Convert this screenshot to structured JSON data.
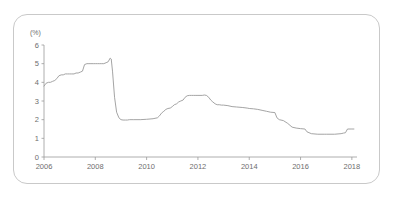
{
  "figure": {
    "background_color": "#ffffff",
    "border_color": "#c9c9c9",
    "axis_color": "#9a9a9a",
    "line_color": "#9a9a9a",
    "text_color": "#6e6e6e"
  },
  "chart_data": {
    "type": "line",
    "title": "",
    "subtitle": "",
    "xlabel": "",
    "ylabel": "",
    "unit_label": "(%)",
    "grid": false,
    "legend": null,
    "xlim": [
      2006.0,
      2018.2
    ],
    "ylim": [
      0,
      6
    ],
    "yticks": [
      0,
      1,
      2,
      3,
      4,
      5,
      6
    ],
    "ytick_labels": [
      "0",
      "1",
      "2",
      "3",
      "4",
      "5",
      "6"
    ],
    "xticks": [
      2006,
      2008,
      2010,
      2012,
      2014,
      2016,
      2018
    ],
    "xtick_labels": [
      "2006",
      "2008",
      "2010",
      "2012",
      "2014",
      "2016",
      "2018"
    ],
    "series": [
      {
        "name": "rate",
        "x": [
          2006.0,
          2006.08,
          2006.17,
          2006.25,
          2006.33,
          2006.42,
          2006.5,
          2006.58,
          2006.67,
          2006.75,
          2006.83,
          2006.92,
          2007.0,
          2007.08,
          2007.17,
          2007.25,
          2007.33,
          2007.42,
          2007.5,
          2007.58,
          2007.67,
          2007.75,
          2007.83,
          2007.92,
          2008.0,
          2008.08,
          2008.17,
          2008.25,
          2008.33,
          2008.42,
          2008.5,
          2008.58,
          2008.62,
          2008.67,
          2008.75,
          2008.83,
          2008.92,
          2009.0,
          2009.08,
          2009.17,
          2009.25,
          2009.33,
          2009.5,
          2009.75,
          2010.0,
          2010.25,
          2010.42,
          2010.5,
          2010.58,
          2010.67,
          2010.75,
          2010.83,
          2010.92,
          2011.0,
          2011.08,
          2011.17,
          2011.25,
          2011.33,
          2011.42,
          2011.5,
          2011.58,
          2011.67,
          2011.75,
          2011.83,
          2011.92,
          2012.0,
          2012.08,
          2012.17,
          2012.25,
          2012.33,
          2012.42,
          2012.5,
          2012.58,
          2012.67,
          2012.75,
          2012.83,
          2012.92,
          2013.0,
          2013.17,
          2013.33,
          2013.5,
          2013.75,
          2013.92,
          2014.0,
          2014.17,
          2014.33,
          2014.5,
          2014.67,
          2014.83,
          2015.0,
          2015.08,
          2015.17,
          2015.33,
          2015.5,
          2015.67,
          2015.83,
          2016.0,
          2016.17,
          2016.25,
          2016.42,
          2016.67,
          2016.92,
          2017.0,
          2017.33,
          2017.58,
          2017.67,
          2017.75,
          2017.83,
          2018.0,
          2018.08
        ],
        "y": [
          3.8,
          3.95,
          4.0,
          4.0,
          4.05,
          4.1,
          4.2,
          4.35,
          4.4,
          4.4,
          4.45,
          4.45,
          4.45,
          4.45,
          4.45,
          4.5,
          4.5,
          4.55,
          4.6,
          4.95,
          5.0,
          5.0,
          5.0,
          5.0,
          5.0,
          5.0,
          5.0,
          5.0,
          5.0,
          5.05,
          5.1,
          5.3,
          5.25,
          4.6,
          3.2,
          2.4,
          2.1,
          2.0,
          1.98,
          1.98,
          1.98,
          2.0,
          2.0,
          2.0,
          2.02,
          2.05,
          2.1,
          2.2,
          2.35,
          2.45,
          2.55,
          2.6,
          2.62,
          2.7,
          2.8,
          2.85,
          2.95,
          3.0,
          3.05,
          3.2,
          3.28,
          3.3,
          3.3,
          3.3,
          3.3,
          3.3,
          3.3,
          3.3,
          3.32,
          3.3,
          3.2,
          3.05,
          2.95,
          2.85,
          2.8,
          2.8,
          2.78,
          2.78,
          2.75,
          2.7,
          2.68,
          2.65,
          2.62,
          2.6,
          2.58,
          2.55,
          2.5,
          2.45,
          2.4,
          2.38,
          2.1,
          2.0,
          1.95,
          1.8,
          1.6,
          1.55,
          1.52,
          1.5,
          1.35,
          1.25,
          1.22,
          1.22,
          1.22,
          1.22,
          1.25,
          1.28,
          1.3,
          1.5,
          1.5,
          1.5
        ]
      }
    ]
  }
}
